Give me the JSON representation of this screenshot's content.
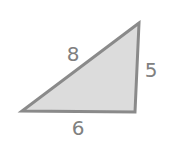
{
  "diagram": {
    "type": "triangle",
    "colors": {
      "fill": "#dcdcdc",
      "stroke": "#8a8a8a",
      "label": "#808080",
      "background": "#ffffff"
    },
    "vertices": {
      "top": [
        139,
        23
      ],
      "bottom_left": [
        22,
        111
      ],
      "bottom_right": [
        135,
        112
      ]
    },
    "sides": [
      {
        "name": "hypotenuse",
        "label": "8"
      },
      {
        "name": "right-side",
        "label": "5"
      },
      {
        "name": "base",
        "label": "6"
      }
    ]
  }
}
